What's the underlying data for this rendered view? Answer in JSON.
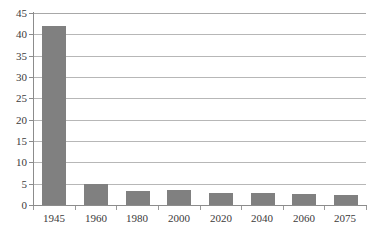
{
  "chart_data": {
    "type": "bar",
    "title": "",
    "subtitle": "",
    "xlabel": "",
    "ylabel": "",
    "categories": [
      "1945",
      "1960",
      "1980",
      "2000",
      "2020",
      "2040",
      "2060",
      "2075"
    ],
    "values": [
      42,
      5,
      3.4,
      3.6,
      2.8,
      2.8,
      2.5,
      2.3
    ],
    "series": [
      {
        "name": "Series 1",
        "values": [
          42,
          5,
          3.4,
          3.6,
          2.8,
          2.8,
          2.5,
          2.3
        ]
      }
    ],
    "ylim": [
      0,
      45
    ],
    "xlim": [
      0,
      8
    ],
    "ytick_labels": [
      "0",
      "5",
      "10",
      "15",
      "20",
      "25",
      "30",
      "35",
      "40",
      "45"
    ],
    "ytick_values": [
      0,
      5,
      10,
      15,
      20,
      25,
      30,
      35,
      40,
      45
    ],
    "ytick_step": 5,
    "xtick_labels": [
      "1945",
      "1960",
      "1980",
      "2000",
      "2020",
      "2040",
      "2060",
      "2075"
    ],
    "grid": true,
    "grid_axis": "y",
    "legend": false,
    "legend_position": "none",
    "annotations": [],
    "colors": {
      "bar": "#808080",
      "gridline": "#b7b7b7",
      "axis": "#8c8c8c",
      "tick_label": "#3b3b3b",
      "background": "#ffffff"
    }
  }
}
